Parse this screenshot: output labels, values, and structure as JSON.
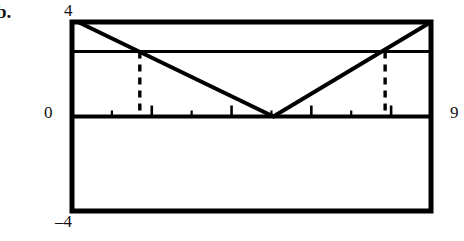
{
  "figure": {
    "problem_label": "b.",
    "axis_labels": {
      "y_top": "4",
      "y_zero": "0",
      "y_bottom": "–4",
      "x_right": "9"
    }
  },
  "chart_data": {
    "type": "line",
    "title": "",
    "subtitle": "",
    "xlabel": "",
    "ylabel": "",
    "xlim": [
      0,
      9
    ],
    "ylim": [
      -4,
      4
    ],
    "grid": false,
    "legend": null,
    "frame": "full-box",
    "x_ticks": [
      1,
      2,
      3,
      4,
      5,
      6,
      7,
      8
    ],
    "x_major_ticks": [
      2,
      4,
      6,
      8
    ],
    "y_tick_labels": [
      "4",
      "0",
      "–4"
    ],
    "series": [
      {
        "name": "v-shaped-absolute-value-function",
        "style": "solid",
        "points": [
          {
            "x": 0.15,
            "y": 4.0
          },
          {
            "x": 5.05,
            "y": 0.0
          },
          {
            "x": 9.0,
            "y": 4.0
          }
        ]
      },
      {
        "name": "horizontal-reference-line",
        "style": "solid",
        "points": [
          {
            "x": 0.0,
            "y": 2.75
          },
          {
            "x": 9.0,
            "y": 2.75
          }
        ]
      },
      {
        "name": "x-axis-line",
        "style": "solid",
        "points": [
          {
            "x": 0.0,
            "y": 0.0
          },
          {
            "x": 9.0,
            "y": 0.0
          }
        ]
      },
      {
        "name": "left-dashed-intersection",
        "style": "dashed",
        "points": [
          {
            "x": 1.7,
            "y": 2.75
          },
          {
            "x": 1.7,
            "y": 0.0
          }
        ]
      },
      {
        "name": "right-dashed-intersection",
        "style": "dashed",
        "points": [
          {
            "x": 7.85,
            "y": 2.75
          },
          {
            "x": 7.85,
            "y": 0.0
          }
        ]
      }
    ],
    "annotations": [
      {
        "name": "problem-label",
        "text": "b.",
        "x": 0,
        "y": 4.4
      },
      {
        "name": "y-top-label",
        "text": "4",
        "x": -0.2,
        "y": 4.35
      },
      {
        "name": "y-zero-label",
        "text": "0",
        "x": -0.75,
        "y": 0.0
      },
      {
        "name": "y-bottom-label",
        "text": "–4",
        "x": -0.5,
        "y": -4.4
      },
      {
        "name": "x-right-label",
        "text": "9",
        "x": 9.5,
        "y": 0.0
      }
    ]
  }
}
